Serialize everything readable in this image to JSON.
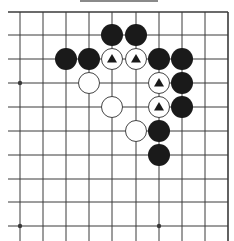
{
  "diagram": {
    "type": "go-board-fragment",
    "label_bar": {
      "color": "#8a8a8a"
    },
    "grid": {
      "cols_x": [
        20,
        43,
        66,
        89,
        112,
        136,
        159,
        182,
        205,
        228
      ],
      "rows_y": [
        12,
        35,
        59,
        83,
        107,
        131,
        155,
        179,
        202,
        226
      ],
      "line_start_x": 8,
      "line_end_x": 228,
      "line_start_y": 12,
      "line_end_y": 241,
      "line_color": "#3a3a3a",
      "edges": {
        "top": true,
        "right": true,
        "left": false,
        "bottom": false
      }
    },
    "star_points": [
      {
        "col": 0,
        "row": 3
      },
      {
        "col": 0,
        "row": 9
      },
      {
        "col": 6,
        "row": 9
      }
    ],
    "stone_radius": 11,
    "colors": {
      "black": "#1a1a1a",
      "white": "#ffffff",
      "white_stroke": "#444444",
      "marker": "#1a1a1a"
    },
    "stones": [
      {
        "color": "black",
        "col": 4,
        "row": 1,
        "marker": null
      },
      {
        "color": "black",
        "col": 5,
        "row": 1,
        "marker": null
      },
      {
        "color": "black",
        "col": 2,
        "row": 2,
        "marker": null
      },
      {
        "color": "black",
        "col": 3,
        "row": 2,
        "marker": null
      },
      {
        "color": "white",
        "col": 4,
        "row": 2,
        "marker": "triangle"
      },
      {
        "color": "white",
        "col": 5,
        "row": 2,
        "marker": "triangle"
      },
      {
        "color": "black",
        "col": 6,
        "row": 2,
        "marker": null
      },
      {
        "color": "black",
        "col": 7,
        "row": 2,
        "marker": null
      },
      {
        "color": "white",
        "col": 3,
        "row": 3,
        "marker": null
      },
      {
        "color": "white",
        "col": 6,
        "row": 3,
        "marker": "triangle"
      },
      {
        "color": "black",
        "col": 7,
        "row": 3,
        "marker": null
      },
      {
        "color": "white",
        "col": 4,
        "row": 4,
        "marker": null
      },
      {
        "color": "white",
        "col": 6,
        "row": 4,
        "marker": "triangle"
      },
      {
        "color": "black",
        "col": 7,
        "row": 4,
        "marker": null
      },
      {
        "color": "white",
        "col": 5,
        "row": 5,
        "marker": null
      },
      {
        "color": "black",
        "col": 6,
        "row": 5,
        "marker": null
      },
      {
        "color": "black",
        "col": 6,
        "row": 6,
        "marker": null
      }
    ]
  }
}
